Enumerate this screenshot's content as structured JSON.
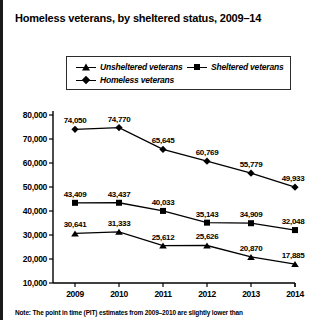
{
  "title": "Homeless veterans, by sheltered status, 2009–14",
  "note": "Note: The point in time (PIT) estimates from 2009–2010 are slightly lower than",
  "legend": {
    "items": [
      {
        "label": "Unsheltered veterans",
        "marker": "triangle-marker-icon",
        "color": "#000000"
      },
      {
        "label": "Sheltered veterans",
        "marker": "square-marker-icon",
        "color": "#000000"
      },
      {
        "label": "Homeless veterans",
        "marker": "diamond-marker-icon",
        "color": "#000000"
      }
    ]
  },
  "axes": {
    "y_ticks": [
      "80,000",
      "70,000",
      "60,000",
      "50,000",
      "40,000",
      "30,000",
      "20,000",
      "10,000"
    ],
    "x_ticks": [
      "2009",
      "2010",
      "2011",
      "2012",
      "2013",
      "2014"
    ]
  },
  "labels": {
    "homeless": [
      "74,050",
      "74,770",
      "65,645",
      "60,769",
      "55,779",
      "49,933"
    ],
    "sheltered": [
      "43,409",
      "43,437",
      "40,033",
      "35,143",
      "34,909",
      "32,048"
    ],
    "unsheltered": [
      "30,641",
      "31,333",
      "25,612",
      "25,626",
      "20,870",
      "17,885"
    ]
  },
  "chart_data": {
    "type": "line",
    "title": "Homeless veterans, by sheltered status, 2009–14",
    "xlabel": "",
    "ylabel": "",
    "categories": [
      "2009",
      "2010",
      "2011",
      "2012",
      "2013",
      "2014"
    ],
    "series": [
      {
        "name": "Homeless veterans",
        "marker": "diamond",
        "values": [
          74050,
          74770,
          65645,
          60769,
          55779,
          49933
        ]
      },
      {
        "name": "Sheltered veterans",
        "marker": "square",
        "values": [
          43409,
          43437,
          40033,
          35143,
          34909,
          32048
        ]
      },
      {
        "name": "Unsheltered veterans",
        "marker": "triangle",
        "values": [
          30641,
          31333,
          25612,
          25626,
          20870,
          17885
        ]
      }
    ],
    "ylim": [
      10000,
      80000
    ],
    "ytick_values": [
      10000,
      20000,
      30000,
      40000,
      50000,
      60000,
      70000,
      80000
    ],
    "grid": false,
    "legend_position": "top",
    "note": "Note: The point in time (PIT) estimates from 2009–2010 are slightly lower than"
  }
}
